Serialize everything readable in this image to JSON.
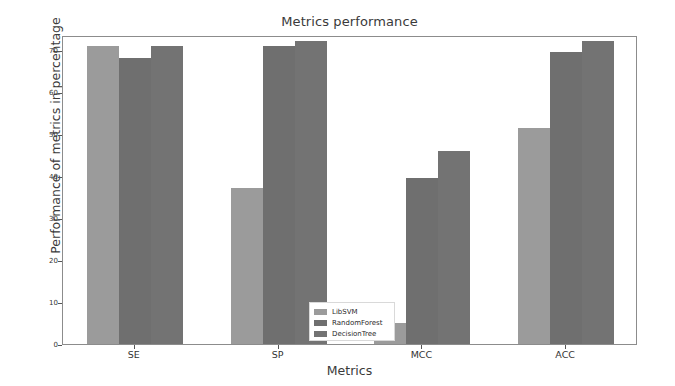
{
  "chart_data": {
    "type": "bar",
    "title": "Metrics performance",
    "xlabel": "Metrics",
    "ylabel": "Performance of metrics in percentage",
    "categories": [
      "SE",
      "SP",
      "MCC",
      "ACC"
    ],
    "series": [
      {
        "name": "LibSVM",
        "color": "#9b9b9b",
        "values": [
          71.0,
          37.0,
          5.0,
          51.5
        ]
      },
      {
        "name": "RandomForest",
        "color": "#6f6f6f",
        "values": [
          68.0,
          71.0,
          39.5,
          69.5
        ]
      },
      {
        "name": "DecisionTree",
        "color": "#737373",
        "values": [
          71.0,
          72.0,
          46.0,
          72.0
        ]
      }
    ],
    "ylim": [
      0,
      73.5
    ],
    "yticks": [
      0,
      10,
      20,
      30,
      40,
      50,
      60,
      70
    ],
    "ytick_labels": [
      "0",
      "10",
      "20",
      "30",
      "40",
      "50",
      "60",
      "70"
    ],
    "grid": false,
    "legend_position": "lower center"
  },
  "legend": {
    "entries": [
      {
        "label": "LibSVM"
      },
      {
        "label": "RandomForest"
      },
      {
        "label": "DecisionTree"
      }
    ]
  }
}
